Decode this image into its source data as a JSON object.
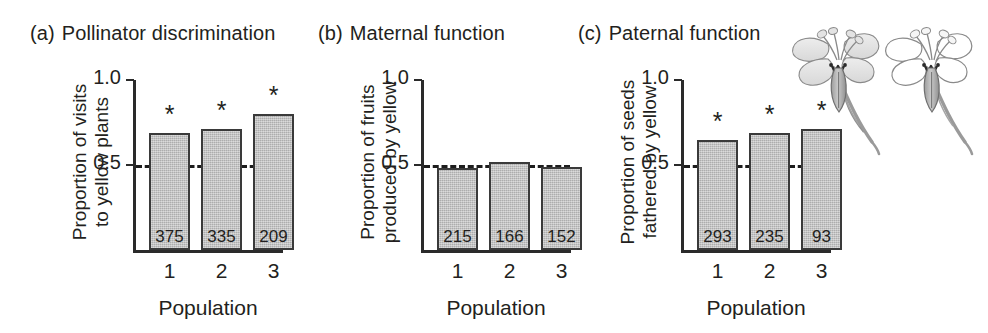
{
  "figure": {
    "panels": [
      {
        "label": "(a)",
        "title": "Pollinator discrimination",
        "ylabel_line1": "Proportion of visits",
        "ylabel_line2": "to yellow plants",
        "xlabel": "Population",
        "yticks": [
          "1.0",
          "0.5"
        ],
        "reference_line_value": "0.5",
        "bars": [
          {
            "category": "1",
            "value": 0.69,
            "n": "375",
            "significant": true,
            "star": "*"
          },
          {
            "category": "2",
            "value": 0.71,
            "n": "335",
            "significant": true,
            "star": "*"
          },
          {
            "category": "3",
            "value": 0.8,
            "n": "209",
            "significant": true,
            "star": "*"
          }
        ]
      },
      {
        "label": "(b)",
        "title": "Maternal function",
        "ylabel_line1": "Proportion of fruits",
        "ylabel_line2": "produced by yellow",
        "xlabel": "Population",
        "yticks": [
          "1.0",
          "0.5"
        ],
        "reference_line_value": "0.5",
        "bars": [
          {
            "category": "1",
            "value": 0.48,
            "n": "215",
            "significant": false,
            "star": ""
          },
          {
            "category": "2",
            "value": 0.52,
            "n": "166",
            "significant": false,
            "star": ""
          },
          {
            "category": "3",
            "value": 0.49,
            "n": "152",
            "significant": false,
            "star": ""
          }
        ]
      },
      {
        "label": "(c)",
        "title": "Paternal function",
        "ylabel_line1": "Proportion of seeds",
        "ylabel_line2": "fathered by yellow",
        "xlabel": "Population",
        "yticks": [
          "1.0",
          "0.5"
        ],
        "reference_line_value": "0.5",
        "bars": [
          {
            "category": "1",
            "value": 0.65,
            "n": "293",
            "significant": true,
            "star": "*"
          },
          {
            "category": "2",
            "value": 0.69,
            "n": "235",
            "significant": true,
            "star": "*"
          },
          {
            "category": "3",
            "value": 0.71,
            "n": "93",
            "significant": true,
            "star": "*"
          }
        ]
      }
    ],
    "illustrations": [
      {
        "name": "flower-yellow-morph",
        "petal_shading": "shaded"
      },
      {
        "name": "flower-white-morph",
        "petal_shading": "unshaded"
      }
    ]
  },
  "chart_data": {
    "type": "bar",
    "xlabel": "Population",
    "ylabel": "Proportion",
    "ylim": [
      0,
      1.0
    ],
    "yticks": [
      0.5,
      1.0
    ],
    "grid": false,
    "legend": "none",
    "reference_line": {
      "value": 0.5,
      "style": "dashed"
    },
    "annotation_note": "* indicates significant deviation from 0.5; numbers inside bars are sample sizes (n)",
    "panels": [
      {
        "panel": "(a)",
        "title": "Pollinator discrimination",
        "ylabel": "Proportion of visits to yellow plants",
        "categories": [
          "1",
          "2",
          "3"
        ],
        "values": [
          0.69,
          0.71,
          0.8
        ],
        "sample_sizes": [
          375,
          335,
          209
        ],
        "significance": [
          "*",
          "*",
          "*"
        ]
      },
      {
        "panel": "(b)",
        "title": "Maternal function",
        "ylabel": "Proportion of fruits produced by yellow",
        "categories": [
          "1",
          "2",
          "3"
        ],
        "values": [
          0.48,
          0.52,
          0.49
        ],
        "sample_sizes": [
          215,
          166,
          152
        ],
        "significance": [
          "",
          "",
          ""
        ]
      },
      {
        "panel": "(c)",
        "title": "Paternal function",
        "ylabel": "Proportion of seeds fathered by yellow",
        "categories": [
          "1",
          "2",
          "3"
        ],
        "values": [
          0.65,
          0.69,
          0.71
        ],
        "sample_sizes": [
          293,
          235,
          93
        ],
        "significance": [
          "*",
          "*",
          "*"
        ]
      }
    ]
  },
  "style": {
    "bar_fill": "#b9b9b9",
    "bar_stroke": "#3a3a3a",
    "axis_color": "#2a2a2a",
    "text_color": "#231f20",
    "background": "#ffffff"
  }
}
